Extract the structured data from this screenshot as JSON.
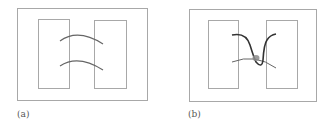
{
  "figure": {
    "panels": [
      {
        "id": "a",
        "label": "(a)",
        "description": "Two separate rectangular blocks inside an outer frame, connected by two parallel arcs"
      },
      {
        "id": "b",
        "label": "(b)",
        "description": "Two rectangular blocks inside an outer frame with a looped dark curve crossing a thin arc, with a gray junction blob at the crossing"
      }
    ],
    "colors": {
      "frame": "#a8a8a8",
      "arc": "#666666",
      "dark_curve": "#333333",
      "blob": "#8c8c8c"
    }
  }
}
